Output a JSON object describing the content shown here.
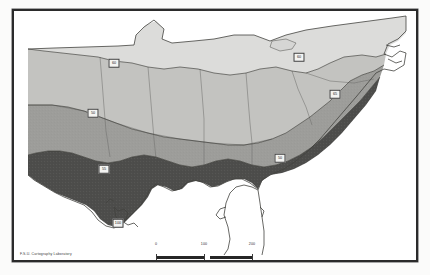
{
  "map": {
    "title": "Southeastern United States isoline map",
    "credit": "F.S.U. Cartography Laboratory",
    "frame_color": "#2b2b2b",
    "background_color": "#ffffff"
  },
  "scale": {
    "unit_label": "Miles",
    "ticks": [
      "0",
      "100",
      "200"
    ]
  },
  "legend_shades": {
    "zone_lightest": "#dcdcda",
    "zone_light": "#c3c3c0",
    "zone_medium": "#9d9d9a",
    "zone_darkest": "#4d4d4b",
    "unshaded": "#ffffff"
  },
  "contour_labels": [
    {
      "id": "label-60-north",
      "value": "60",
      "x": 100,
      "y": 52
    },
    {
      "id": "label-60-east",
      "value": "60",
      "x": 285,
      "y": 46
    },
    {
      "id": "label-65-coast",
      "value": "65",
      "x": 321,
      "y": 83
    },
    {
      "id": "label-50-west",
      "value": "50",
      "x": 79,
      "y": 102
    },
    {
      "id": "label-55-gulf",
      "value": "55",
      "x": 90,
      "y": 158
    },
    {
      "id": "label-50-se",
      "value": "50",
      "x": 266,
      "y": 147
    },
    {
      "id": "label-100-delta",
      "value": "100",
      "x": 104,
      "y": 212
    }
  ]
}
